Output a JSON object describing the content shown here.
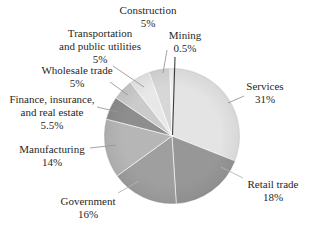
{
  "figure": {
    "background": "#ffffff",
    "text_color": "#272727"
  },
  "chart_data": {
    "type": "pie",
    "title": "",
    "unit": "%",
    "total": 100,
    "start_angle_deg": 0,
    "direction": "clockwise",
    "legend_position": "none",
    "label_style": "callout",
    "leader_line_color": "#999999",
    "slices": [
      {
        "name": "Services",
        "value": 31,
        "pct_label": "31%",
        "color": "#e4e4e4",
        "label_lines": [
          "Services"
        ]
      },
      {
        "name": "Retail trade",
        "value": 18,
        "pct_label": "18%",
        "color": "#979797",
        "label_lines": [
          "Retail trade"
        ]
      },
      {
        "name": "Government",
        "value": 16,
        "pct_label": "16%",
        "color": "#9f9f9f",
        "label_lines": [
          "Government"
        ]
      },
      {
        "name": "Manufacturing",
        "value": 14,
        "pct_label": "14%",
        "color": "#b6b6b6",
        "label_lines": [
          "Manufacturing"
        ]
      },
      {
        "name": "Finance, insurance, and real estate",
        "value": 5.5,
        "pct_label": "5.5%",
        "color": "#8e8e8e",
        "label_lines": [
          "Finance, insurance,",
          "and real estate"
        ]
      },
      {
        "name": "Wholesale trade",
        "value": 5,
        "pct_label": "5%",
        "color": "#cbcbcb",
        "label_lines": [
          "Wholesale trade"
        ]
      },
      {
        "name": "Transportation and public utilities",
        "value": 5,
        "pct_label": "5%",
        "color": "#e8e8e8",
        "label_lines": [
          "Transportation",
          "and public utilities"
        ]
      },
      {
        "name": "Construction",
        "value": 5,
        "pct_label": "5%",
        "color": "#d7d7d7",
        "label_lines": [
          "Construction"
        ]
      },
      {
        "name": "Mining",
        "value": 0.5,
        "pct_label": "0.5%",
        "color": "#efefef",
        "label_lines": [
          "Mining"
        ]
      }
    ]
  }
}
